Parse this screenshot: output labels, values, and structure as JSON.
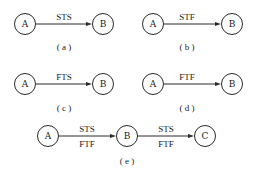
{
  "diagrams": [
    {
      "id": "a",
      "caption": "( a )",
      "nodes": [
        {
          "label": "A"
        },
        {
          "label": "B"
        }
      ],
      "edges": [
        {
          "from": "A",
          "to": "B",
          "labels_above": "STS",
          "labels_below": ""
        }
      ]
    },
    {
      "id": "b",
      "caption": "( b )",
      "nodes": [
        {
          "label": "A"
        },
        {
          "label": "B"
        }
      ],
      "edges": [
        {
          "from": "A",
          "to": "B",
          "labels_above": "STF",
          "labels_below": ""
        }
      ]
    },
    {
      "id": "c",
      "caption": "( c )",
      "nodes": [
        {
          "label": "A"
        },
        {
          "label": "B"
        }
      ],
      "edges": [
        {
          "from": "A",
          "to": "B",
          "labels_above": "FTS",
          "labels_below": ""
        }
      ]
    },
    {
      "id": "d",
      "caption": "( d )",
      "nodes": [
        {
          "label": "A"
        },
        {
          "label": "B"
        }
      ],
      "edges": [
        {
          "from": "A",
          "to": "B",
          "labels_above": "FTF",
          "labels_below": ""
        }
      ]
    },
    {
      "id": "e",
      "caption": "( e )",
      "nodes": [
        {
          "label": "A"
        },
        {
          "label": "B"
        },
        {
          "label": "C"
        }
      ],
      "edges": [
        {
          "from": "A",
          "to": "B",
          "labels_above": "STS",
          "labels_below": "FTF"
        },
        {
          "from": "B",
          "to": "C",
          "labels_above": "STS",
          "labels_below": "FTF"
        }
      ]
    }
  ]
}
